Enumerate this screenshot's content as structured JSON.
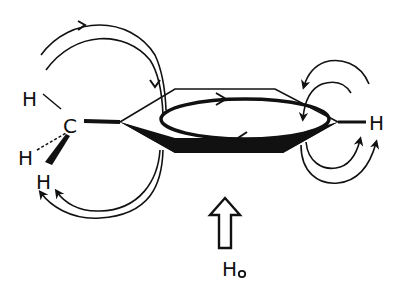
{
  "diagram": {
    "type": "ring-current-shielding",
    "labels": {
      "methyl_carbon": "C",
      "methyl_h_top": "H",
      "methyl_h_left": "H",
      "methyl_h_bottom": "H",
      "ring_h_right": "H",
      "field_symbol": "H",
      "field_subscript": "o"
    },
    "colors": {
      "ink": "#111111",
      "background": "#ffffff"
    }
  }
}
